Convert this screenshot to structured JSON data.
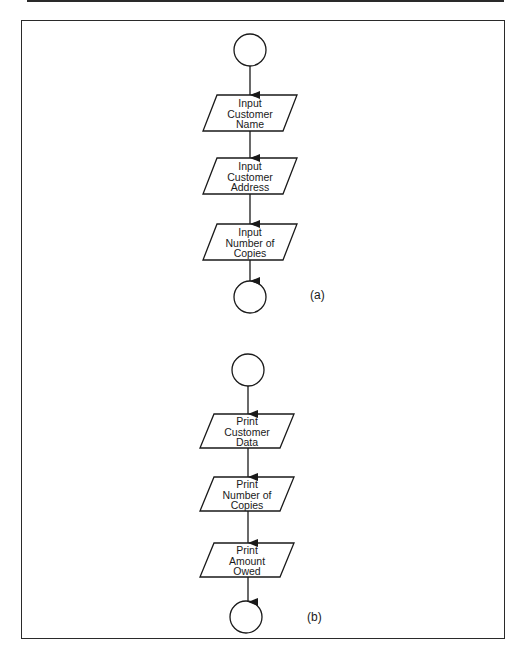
{
  "diagram": {
    "type": "flowchart",
    "panels": [
      {
        "label": "(a)",
        "start": "connector-circle",
        "steps": [
          {
            "line1": "Input",
            "line2": "Customer",
            "line3": "Name"
          },
          {
            "line1": "Input",
            "line2": "Customer",
            "line3": "Address"
          },
          {
            "line1": "Input",
            "line2": "Number of",
            "line3": "Copies"
          }
        ],
        "end": "connector-circle"
      },
      {
        "label": "(b)",
        "start": "connector-circle",
        "steps": [
          {
            "line1": "Print",
            "line2": "Customer",
            "line3": "Data"
          },
          {
            "line1": "Print",
            "line2": "Number of",
            "line3": "Copies"
          },
          {
            "line1": "Print",
            "line2": "Amount",
            "line3": "Owed"
          }
        ],
        "end": "connector-circle"
      }
    ],
    "colors": {
      "stroke": "#1a1a1a",
      "background": "#ffffff"
    }
  }
}
